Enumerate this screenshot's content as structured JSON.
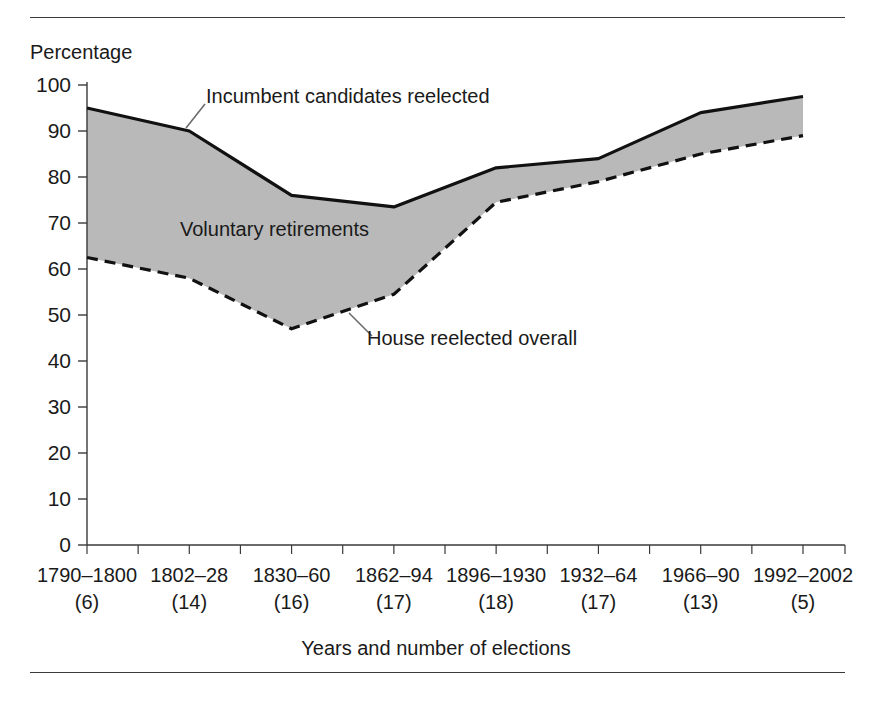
{
  "figure": {
    "y_axis_title": "Percentage",
    "x_axis_title": "Years and number of elections",
    "annotations": {
      "incumbent": "Incumbent candidates reelected",
      "voluntary": "Voluntary retirements",
      "house": "House reelected overall"
    }
  },
  "colors": {
    "fill": "#b9b9b9",
    "line": "#111111",
    "axis": "#3a3a3a",
    "text": "#1a1a1a"
  },
  "chart_data": {
    "type": "area",
    "title": "",
    "subtitle": "",
    "xlabel": "Years and number of elections",
    "ylabel": "Percentage",
    "ylim": [
      0,
      100
    ],
    "yticks": [
      0,
      10,
      20,
      30,
      40,
      50,
      60,
      70,
      80,
      90,
      100
    ],
    "ytick_labels": [
      "0",
      "10",
      "20",
      "30",
      "40",
      "50",
      "60",
      "70",
      "80",
      "90",
      "100"
    ],
    "grid": false,
    "legend_position": "inline-annotations",
    "categories": [
      "1790–1800",
      "1802–28",
      "1830–60",
      "1862–94",
      "1896–1930",
      "1932–64",
      "1966–90",
      "1992–2002"
    ],
    "category_counts": [
      "(6)",
      "(14)",
      "(16)",
      "(17)",
      "(18)",
      "(17)",
      "(13)",
      "(5)"
    ],
    "xtick_labels": [
      "1790–1800\n(6)",
      "1802–28\n(14)",
      "1830–60\n(16)",
      "1862–94\n(17)",
      "1896–1930\n(18)",
      "1932–64\n(17)",
      "1966–90\n(13)",
      "1992–2002\n(5)"
    ],
    "series": [
      {
        "name": "Incumbent candidates reelected",
        "style": "solid",
        "values": [
          95,
          90,
          76,
          73.5,
          82,
          84,
          94,
          97.5
        ]
      },
      {
        "name": "House reelected overall",
        "style": "dashed",
        "values": [
          62.5,
          58,
          47,
          54.5,
          74.5,
          79,
          85,
          89
        ]
      }
    ],
    "band": {
      "name": "Voluntary retirements",
      "upper_series": "Incumbent candidates reelected",
      "lower_series": "House reelected overall",
      "fill": "#b9b9b9"
    }
  }
}
